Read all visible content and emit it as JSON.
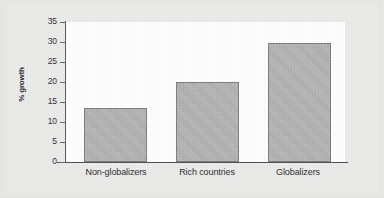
{
  "chart_data": {
    "type": "bar",
    "title": "",
    "subtitle": "",
    "xlabel": "",
    "ylabel": "% growth",
    "categories": [
      "Non-globalizers",
      "Rich countries",
      "Globalizers"
    ],
    "values": [
      13.5,
      20,
      29.7
    ],
    "ylim": [
      0,
      35
    ],
    "yticks": [
      "0",
      "5",
      "10",
      "15",
      "20",
      "25",
      "30",
      "35"
    ],
    "ytick_values": [
      0,
      5,
      10,
      15,
      20,
      25,
      30,
      35
    ],
    "grid": false,
    "legend": "none",
    "series": [
      {
        "name": "% growth",
        "values": [
          13.5,
          20,
          29.7
        ],
        "color": "#b2b2b2",
        "edge_color": "#7d7d7f"
      }
    ],
    "annotations": [],
    "colors": {
      "bar_fill": "#b2b2b2",
      "bar_edge": "#7d7d7f",
      "axis": "#4e4e50",
      "plot_background": "#ffffff",
      "figure_background": "#e9e9e7",
      "text": "#2b2b2d"
    }
  }
}
